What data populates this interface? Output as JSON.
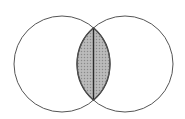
{
  "diagram": {
    "type": "venn",
    "sets": [
      {
        "id": "left",
        "cx": 62,
        "cy": 64,
        "r": 48
      },
      {
        "id": "right",
        "cx": 125,
        "cy": 64,
        "r": 48
      }
    ],
    "intersection": {
      "shaded": true,
      "divider_line": "vertical"
    },
    "colors": {
      "background": "#ffffff",
      "stroke": "#555555",
      "lens_fill": "#b4b4b4",
      "lens_stipple": "#8a8a8a",
      "lens_stroke": "#333333",
      "divider": "#2a2a2a"
    }
  }
}
